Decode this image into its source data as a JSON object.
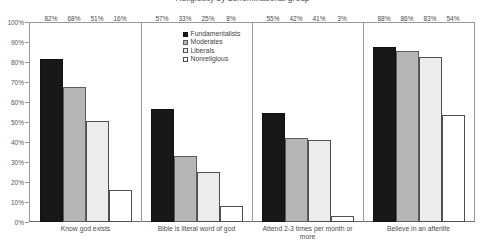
{
  "chart": {
    "title_clipped": "Religiosity by denominational group",
    "axis": {
      "y_ticks": [
        "100%",
        "90%",
        "80%",
        "70%",
        "60%",
        "50%",
        "40%",
        "30%",
        "20%",
        "10%",
        "0%"
      ]
    }
  },
  "chart_data": {
    "type": "bar",
    "title": "",
    "xlabel": "",
    "ylabel": "",
    "ylim": [
      0,
      100
    ],
    "grid": false,
    "legend_position": "top-center",
    "categories": [
      "Know god exists",
      "Bible is literal word of god",
      "Attend 2-3 times per month or more",
      "Believe in an afterlife"
    ],
    "series": [
      {
        "name": "Fundamentalists",
        "values": [
          82,
          57,
          55,
          88
        ],
        "labels": [
          "82%",
          "57%",
          "55%",
          "88%"
        ],
        "color": "#181818"
      },
      {
        "name": "Moderates",
        "values": [
          68,
          33,
          42,
          86
        ],
        "labels": [
          "68%",
          "33%",
          "42%",
          "86%"
        ],
        "color": "#b6b6b6"
      },
      {
        "name": "Liberals",
        "values": [
          51,
          25,
          41,
          83
        ],
        "labels": [
          "51%",
          "25%",
          "41%",
          "83%"
        ],
        "color": "#ececec"
      },
      {
        "name": "Nonreligious",
        "values": [
          16,
          8,
          3,
          54
        ],
        "labels": [
          "16%",
          "8%",
          "3%",
          "54%"
        ],
        "color": "#ffffff"
      }
    ]
  }
}
